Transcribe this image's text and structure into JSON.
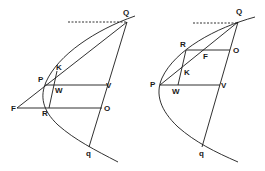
{
  "figures": [
    {
      "id": "left",
      "labels": {
        "Q": "Q",
        "K": "K",
        "P": "P",
        "W": "W",
        "V": "V",
        "F": "F",
        "R": "R",
        "O": "O",
        "q": "q"
      }
    },
    {
      "id": "right",
      "labels": {
        "Q": "Q",
        "R": "R",
        "F": "F",
        "O": "O",
        "K": "K",
        "P": "P",
        "W": "W",
        "V": "V",
        "q": "q"
      }
    }
  ],
  "colors": {
    "ink": "#1a1a1a",
    "background": "#ffffff"
  }
}
